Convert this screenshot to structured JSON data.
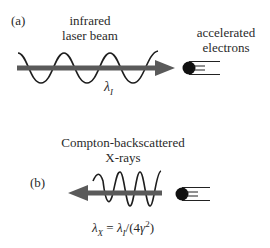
{
  "figure": {
    "colors": {
      "arrow": "#5a5a5a",
      "wave": "#1e1e1e",
      "electron": "#111111",
      "text": "#2a2a2a",
      "background": "#ffffff"
    },
    "panel_a": {
      "label": "(a)",
      "beam_label_line1": "infrared",
      "beam_label_line2": "laser beam",
      "electron_label_line1": "accelerated",
      "electron_label_line2": "electrons",
      "wavelength_symbol": "λ",
      "wavelength_subscript": "I",
      "arrow_direction": "right",
      "icons": [
        "wave-icon",
        "arrow-right-icon",
        "electron-icon"
      ]
    },
    "panel_b": {
      "label": "(b)",
      "xray_label_line1": "Compton-backscattered",
      "xray_label_line2": "X-rays",
      "formula": {
        "lhs_symbol": "λ",
        "lhs_subscript": "X",
        "equals": " = ",
        "rhs_symbol": "λ",
        "rhs_subscript": "I",
        "rhs_rest_open": "/(4",
        "gamma": "γ",
        "exponent": "2",
        "rhs_rest_close": ")"
      },
      "arrow_direction": "left",
      "icons": [
        "wave-icon",
        "arrow-left-icon",
        "electron-icon"
      ]
    }
  }
}
